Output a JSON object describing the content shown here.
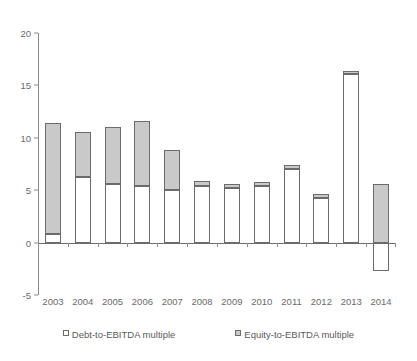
{
  "chart_data": {
    "type": "bar",
    "stacked": true,
    "title": "",
    "subtitle": "",
    "xlabel": "",
    "ylabel": "",
    "ylim": [
      -5,
      20
    ],
    "yticks": [
      20,
      15,
      10,
      5,
      0,
      -5
    ],
    "ytick_labels": [
      "20",
      "15",
      "10",
      "5",
      "0",
      "-5"
    ],
    "grid": false,
    "legend_position": "bottom",
    "categories": [
      "2003",
      "2004",
      "2005",
      "2006",
      "2007",
      "2008",
      "2009",
      "2010",
      "2011",
      "2012",
      "2013",
      "2014"
    ],
    "series": [
      {
        "name": "Debt-to-EBITDA multiple",
        "color": "#ffffff",
        "values": [
          0.8,
          6.3,
          5.6,
          5.4,
          5.0,
          5.4,
          5.2,
          5.4,
          7.0,
          4.3,
          16.1,
          -2.7
        ]
      },
      {
        "name": "Equity-to-EBITDA multiple",
        "color": "#c9c9c9",
        "values": [
          10.6,
          4.3,
          5.4,
          6.2,
          3.8,
          0.5,
          0.4,
          0.4,
          0.4,
          0.3,
          0.3,
          5.6
        ]
      }
    ],
    "totals": [
      11.4,
      10.6,
      11.0,
      11.6,
      8.8,
      5.9,
      5.6,
      5.8,
      7.4,
      4.6,
      16.4,
      5.6
    ]
  },
  "legend": {
    "items": [
      {
        "label": "Debt-to-EBITDA multiple",
        "swatch": "debt"
      },
      {
        "label": "Equity-to-EBITDA multiple",
        "swatch": "equity"
      }
    ]
  },
  "colors": {
    "equity_fill": "#c9c9c9",
    "debt_fill": "#ffffff",
    "bar_border": "#6b6b6b",
    "axis": "#8a8a8a",
    "text": "#6a6a6a"
  }
}
